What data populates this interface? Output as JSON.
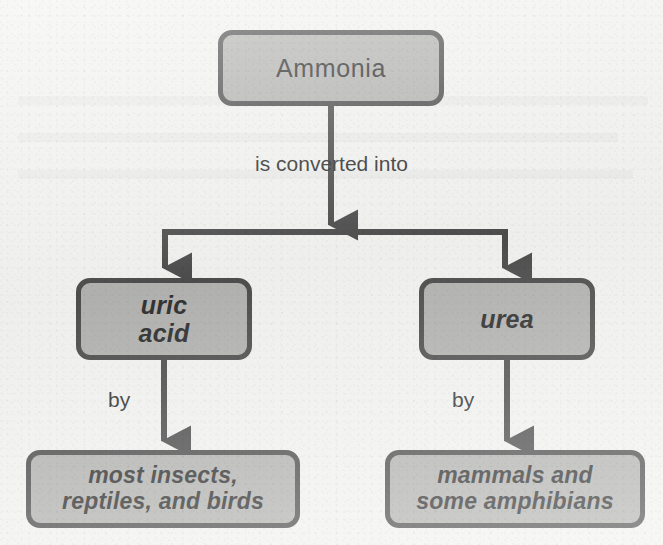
{
  "diagram": {
    "type": "flowchart",
    "colors": {
      "page_background": "#f2f2f0",
      "node_fill": "#b2b2b0",
      "node_border": "#4d4d4d",
      "connector": "#4d4d4d",
      "text": "#2f2f2f"
    },
    "nodes": {
      "ammonia": {
        "label": "Ammonia",
        "style": "regular"
      },
      "uric_acid": {
        "line1": "uric",
        "line2": "acid",
        "style": "bold-italic"
      },
      "urea": {
        "label": "urea",
        "style": "bold-italic"
      },
      "uricotelic_animals": {
        "line1": "most insects,",
        "line2": "reptiles, and birds",
        "style": "bold-italic"
      },
      "ureotelic_animals": {
        "line1": "mammals and",
        "line2": "some amphibians",
        "style": "bold-italic"
      }
    },
    "edges": {
      "converted_into": "is converted into",
      "by_left": "by",
      "by_right": "by"
    }
  }
}
